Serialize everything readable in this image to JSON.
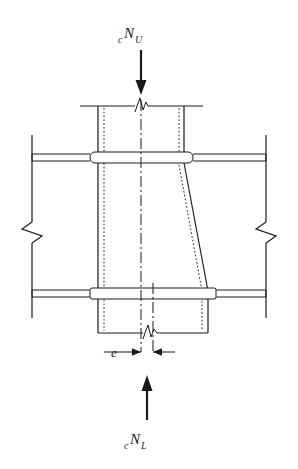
{
  "figure": {
    "name": "column-splice-eccentricity-diagram",
    "type": "engineering-line-drawing",
    "background_color": "#ffffff",
    "line_color": "#1a1a1a",
    "labels": {
      "top_load": {
        "prefix": "c",
        "symbol": "N",
        "subscript": "U",
        "full": "cNU"
      },
      "bottom_load": {
        "prefix": "c",
        "symbol": "N",
        "subscript": "L",
        "full": "cNL"
      },
      "eccentricity": {
        "symbol": "e"
      }
    },
    "elements": {
      "upper_column_label": "upper column",
      "lower_column_label": "lower column",
      "upper_beam_label": "upper beam flange",
      "lower_beam_label": "lower beam flange",
      "taper_label": "tapered column face",
      "break_symbol_label": "break symbol",
      "centerline_label": "centerline",
      "dimension_label": "eccentricity dimension"
    }
  }
}
